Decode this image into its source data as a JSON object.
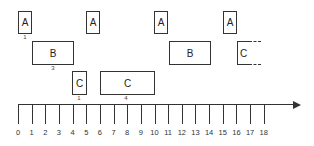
{
  "diagram": {
    "title": "",
    "axis": {
      "ticks": [
        "0",
        "1",
        "2",
        "3",
        "4",
        "5",
        "6",
        "7",
        "8",
        "9",
        "10",
        "11",
        "12",
        "13",
        "14",
        "15",
        "16",
        "17",
        "18"
      ],
      "arrow": true
    },
    "row_a": [
      {
        "label": "A",
        "start": 0,
        "end": 1,
        "note": "1"
      },
      {
        "label": "A",
        "start": 5,
        "end": 6,
        "note": ""
      },
      {
        "label": "A",
        "start": 10,
        "end": 11,
        "note": ""
      },
      {
        "label": "A",
        "start": 15,
        "end": 16,
        "note": ""
      }
    ],
    "row_b": [
      {
        "label": "B",
        "start": 1,
        "end": 4,
        "note": "3"
      },
      {
        "label": "B",
        "start": 11,
        "end": 14,
        "note": ""
      }
    ],
    "row_c": [
      {
        "label": "C",
        "start": 4,
        "end": 5,
        "note": "1"
      },
      {
        "label": "C",
        "start": 6,
        "end": 10,
        "note": "4"
      },
      {
        "label": "C",
        "start": 16,
        "end": 17.5,
        "note": "",
        "continues": true
      }
    ]
  }
}
